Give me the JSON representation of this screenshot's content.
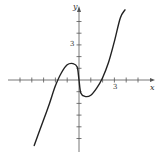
{
  "chart_data": {
    "type": "line",
    "title": "",
    "xlabel": "x",
    "ylabel": "y",
    "x_tick_label": "3",
    "y_tick_label": "3",
    "xlim": [
      -5,
      6
    ],
    "ylim": [
      -6,
      6
    ],
    "grid": false,
    "legend": null,
    "series": [
      {
        "name": "f(x)",
        "x": [
          -3.8,
          -3.0,
          -2.5,
          -2.0,
          -1.5,
          -1.0,
          -0.5,
          -0.15,
          0.0,
          0.15,
          0.5,
          1.0,
          1.5,
          2.0,
          2.5,
          3.0,
          3.5,
          3.9
        ],
        "y": [
          -5.6,
          -3.4,
          -2.0,
          -0.5,
          0.6,
          1.3,
          1.4,
          1.1,
          0.0,
          -1.1,
          -1.4,
          -1.3,
          -0.7,
          0.2,
          1.5,
          3.3,
          5.3,
          6.0
        ]
      }
    ],
    "key_points": {
      "x_intercepts": [
        -2,
        0,
        2
      ],
      "local_max": [
        -0.5,
        1.4
      ],
      "local_min": [
        0.5,
        -1.4
      ]
    }
  },
  "axes": {
    "x_label": "x",
    "y_label": "y",
    "x_tick_3": "3",
    "y_tick_3": "3"
  },
  "colors": {
    "curve": "#222222",
    "axis": "#555555"
  }
}
